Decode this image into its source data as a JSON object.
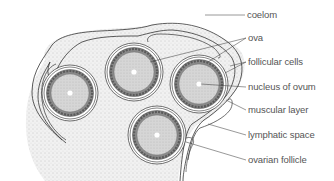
{
  "diagram": {
    "type": "labeled cross-section illustration",
    "colors": {
      "line": "#333333",
      "label_text": "#555555",
      "stipple_fill": "#e6e6e6",
      "ovum_fill": "#d4d4d4",
      "follicle_ring": "#7a7a7a"
    },
    "labels": [
      {
        "id": "coelom",
        "text": "coelom",
        "x": 247,
        "y": 10
      },
      {
        "id": "ova",
        "text": "ova",
        "x": 248,
        "y": 33
      },
      {
        "id": "follicular-cells",
        "text": "follicular cells",
        "x": 248,
        "y": 57
      },
      {
        "id": "nucleus-of-ovum",
        "text": "nucleus of ovum",
        "x": 248,
        "y": 82
      },
      {
        "id": "muscular-layer",
        "text": "muscular layer",
        "x": 248,
        "y": 105
      },
      {
        "id": "lymphatic-space",
        "text": "lymphatic space",
        "x": 248,
        "y": 130
      },
      {
        "id": "ovarian-follicle",
        "text": "ovarian follicle",
        "x": 248,
        "y": 155
      }
    ],
    "ova": [
      {
        "id": "ovum-1",
        "cx": 70,
        "cy": 93,
        "r": 28
      },
      {
        "id": "ovum-2",
        "cx": 134,
        "cy": 72,
        "r": 29
      },
      {
        "id": "ovum-3",
        "cx": 199,
        "cy": 84,
        "r": 29
      },
      {
        "id": "ovum-4",
        "cx": 157,
        "cy": 135,
        "r": 29
      }
    ]
  }
}
